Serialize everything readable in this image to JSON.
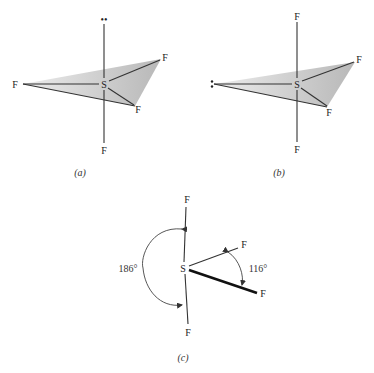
{
  "figure": {
    "panels": [
      {
        "id": "a",
        "caption": "(a)",
        "central_atom": "S",
        "axial_top": "••",
        "axial_bottom": "F",
        "equatorial_left": "F",
        "equatorial_upper_right": "F",
        "equatorial_lower_right": "F",
        "description": "Trigonal bipyramid with lone pair in axial position"
      },
      {
        "id": "b",
        "caption": "(b)",
        "central_atom": "S",
        "axial_top": "F",
        "axial_bottom": "F",
        "equatorial_left": ":",
        "equatorial_upper_right": "F",
        "equatorial_lower_right": "F",
        "description": "Trigonal bipyramid with lone pair in equatorial position"
      },
      {
        "id": "c",
        "caption": "(c)",
        "central_atom": "S",
        "top": "F",
        "bottom": "F",
        "upper_right": "F",
        "lower_right": "F",
        "angle_axial": "186°",
        "angle_equatorial": "116°",
        "description": "Observed SF4 geometry with bond angles"
      }
    ],
    "colors": {
      "ink": "#222222",
      "plane_light": "#e2e2e2",
      "plane_dark": "#b8b8b8",
      "background": "#ffffff"
    }
  }
}
